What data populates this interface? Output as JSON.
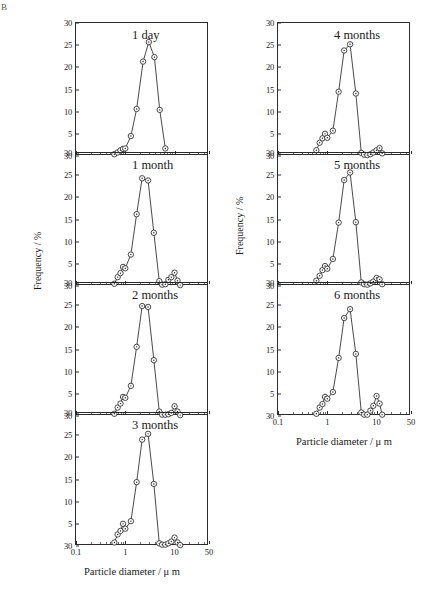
{
  "figure": {
    "label": "B",
    "xlabel": "Particle diameter / μ m",
    "ylabel": "Frequency / %"
  },
  "axes": {
    "x_ticks": [
      "0.1",
      "1",
      "10",
      "50"
    ],
    "x_tick_values": [
      0.1,
      1,
      10,
      50
    ],
    "y_ticks": [
      "30",
      "25",
      "20",
      "15",
      "10",
      "5",
      "30"
    ],
    "y_tick_values": [
      30,
      25,
      20,
      15,
      10,
      5,
      0
    ],
    "xlim": [
      0.1,
      50
    ],
    "ylim": [
      0,
      30
    ],
    "xscale": "log"
  },
  "chart_data": {
    "type": "line",
    "xlabel": "Particle diameter / μ m",
    "ylabel": "Frequency / %",
    "xscale": "log",
    "xlim": [
      0.1,
      50
    ],
    "ylim": [
      0,
      30
    ],
    "grid": false,
    "legend": "none",
    "marker": "open-circle-with-dot",
    "panels": [
      {
        "label": "1 day",
        "column": "left",
        "x": [
          0.6,
          0.7,
          0.8,
          0.9,
          1.0,
          1.3,
          1.7,
          2.3,
          3.0,
          3.9,
          5.0,
          6.5
        ],
        "y": [
          0.4,
          0.8,
          1.3,
          1.6,
          1.7,
          4.5,
          10.6,
          21.3,
          25.7,
          22.3,
          10.4,
          1.7
        ]
      },
      {
        "label": "1 month",
        "column": "left",
        "x": [
          0.6,
          0.7,
          0.8,
          0.9,
          1.0,
          1.3,
          1.7,
          2.2,
          2.9,
          3.8,
          4.9,
          5.6,
          6.5,
          7.5,
          8.6,
          10.0,
          11.5,
          13.0
        ],
        "y": [
          0.5,
          2.0,
          2.9,
          4.3,
          4.0,
          7.1,
          16.2,
          24.3,
          23.8,
          12.0,
          1.1,
          0.3,
          0.4,
          1.4,
          2.0,
          3.0,
          1.2,
          0.2
        ]
      },
      {
        "label": "2 months",
        "column": "left",
        "x": [
          0.6,
          0.7,
          0.8,
          0.9,
          1.0,
          1.3,
          1.7,
          2.2,
          2.9,
          3.8,
          4.9,
          5.6,
          6.5,
          7.5,
          8.6,
          10.0,
          11.5,
          13.0
        ],
        "y": [
          0.5,
          1.9,
          2.8,
          4.3,
          4.1,
          6.8,
          15.6,
          24.8,
          24.6,
          12.6,
          1.0,
          0.3,
          0.3,
          0.4,
          0.7,
          2.2,
          1.0,
          0.2
        ]
      },
      {
        "label": "3 months",
        "column": "left",
        "x": [
          0.6,
          0.7,
          0.8,
          0.9,
          1.0,
          1.3,
          1.7,
          2.2,
          2.9,
          3.8,
          4.9,
          5.6,
          6.5,
          7.5,
          8.6,
          10.0,
          11.5,
          13.0
        ],
        "y": [
          0.8,
          2.6,
          3.4,
          5.0,
          3.9,
          5.6,
          14.4,
          24.0,
          25.3,
          14.0,
          0.6,
          0.3,
          0.3,
          0.6,
          1.0,
          1.9,
          0.8,
          0.2
        ]
      },
      {
        "label": "4 months",
        "column": "right",
        "x": [
          0.6,
          0.7,
          0.8,
          0.9,
          1.0,
          1.3,
          1.7,
          2.2,
          2.9,
          3.8,
          4.9,
          5.6,
          6.5,
          7.5,
          8.6,
          10.0,
          11.5,
          13.0
        ],
        "y": [
          1.3,
          3.0,
          4.0,
          5.0,
          4.1,
          5.7,
          14.5,
          23.8,
          25.2,
          14.1,
          0.7,
          0.3,
          0.2,
          0.4,
          0.8,
          1.3,
          1.8,
          0.6
        ]
      },
      {
        "label": "5 months",
        "column": "right",
        "x": [
          0.6,
          0.7,
          0.8,
          0.9,
          1.0,
          1.3,
          1.7,
          2.2,
          2.9,
          3.8,
          4.9,
          5.6,
          6.5,
          7.5,
          8.6,
          10.0,
          11.5,
          13.0
        ],
        "y": [
          1.2,
          2.3,
          3.6,
          4.5,
          3.9,
          6.1,
          14.3,
          23.9,
          25.6,
          14.4,
          0.8,
          0.4,
          0.3,
          0.6,
          1.0,
          1.8,
          1.5,
          0.4
        ]
      },
      {
        "label": "6 months",
        "column": "right",
        "x": [
          0.6,
          0.7,
          0.8,
          0.9,
          1.0,
          1.3,
          1.7,
          2.2,
          2.9,
          3.8,
          4.9,
          5.6,
          6.5,
          7.5,
          8.6,
          10.0,
          11.5,
          13.0
        ],
        "y": [
          0.5,
          1.9,
          2.7,
          4.3,
          3.9,
          5.4,
          13.1,
          22.1,
          24.1,
          14.0,
          0.8,
          0.3,
          0.3,
          1.2,
          2.3,
          4.5,
          2.8,
          0.3
        ]
      }
    ]
  }
}
